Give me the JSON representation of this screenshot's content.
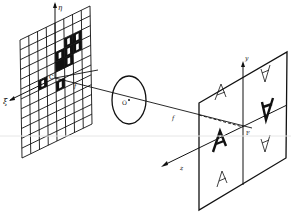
{
  "figure": {
    "type": "optical Fourier transform diagram",
    "labels": {
      "object_plane_vertical_axis": "η",
      "object_plane_horizontal_axis": "ξ",
      "object_plane_origin": "C",
      "lens_center": "O",
      "focal_length_left": "f",
      "focal_length_right": "f",
      "image_plane_vertical_axis": "y",
      "optical_axis": "z",
      "image_plane_focus": "F"
    },
    "object_plane": {
      "grid_columns": 8,
      "grid_rows": 12,
      "description": "grid with black filled cells containing white apertures"
    },
    "image_plane": {
      "quadrants": 4,
      "letters": [
        "A",
        "A",
        "A",
        "A",
        "A",
        "A"
      ],
      "bold_letters": [
        "A",
        "A"
      ]
    },
    "colors": {
      "ink": "#111111",
      "background": "#ffffff"
    }
  }
}
